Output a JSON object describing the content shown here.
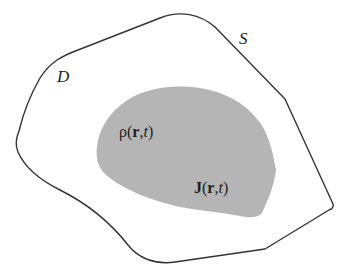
{
  "diagram": {
    "type": "region-diagram",
    "outer_region": {
      "name": "D",
      "boundary_label": "S",
      "stroke_color": "#333333",
      "fill_color": "#ffffff"
    },
    "inner_region": {
      "fill_color": "#b3b3b3",
      "labels": {
        "density": {
          "symbol": "ρ",
          "open": "(",
          "vector": "r",
          "sep": ",",
          "time": "t",
          "close": ")"
        },
        "current": {
          "symbol": "J",
          "open": "(",
          "vector": "r",
          "sep": ",",
          "time": "t",
          "close": ")"
        }
      }
    },
    "labels": {
      "region": "D",
      "surface": "S"
    }
  }
}
